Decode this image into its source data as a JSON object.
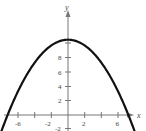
{
  "chart_data": {
    "type": "line",
    "title": "",
    "xlabel": "x",
    "ylabel": "y",
    "xlim": [
      -7,
      7
    ],
    "ylim": [
      -2,
      12
    ],
    "x_ticks": [
      -6,
      -4,
      -2,
      2,
      4,
      6
    ],
    "x_tick_labels": [
      "-6",
      "-4",
      "-2",
      "2",
      "4",
      "6"
    ],
    "y_ticks": [
      -2,
      2,
      4,
      6,
      8,
      10
    ],
    "y_tick_labels": [
      "-2",
      "2",
      "4",
      "6",
      "8",
      ""
    ],
    "grid": false,
    "legend": null,
    "series": [
      {
        "name": "parabola",
        "equation": "y = 10.5 - 0.8x^2",
        "x": [
          -3.9,
          -3,
          -2,
          -1,
          0,
          1,
          2,
          3,
          3.9
        ],
        "y": [
          -1.7,
          3.3,
          7.3,
          9.7,
          10.5,
          9.7,
          7.3,
          3.3,
          -1.7
        ]
      }
    ]
  },
  "labels": {
    "x_axis": "x",
    "y_axis": "y",
    "xt_m6": "-6",
    "xt_m4": "-4",
    "xt_m2": "-2",
    "xt_2": "2",
    "xt_4": "4",
    "xt_6": "6",
    "yt_m2": "-2",
    "yt_2": "2",
    "yt_4": "4",
    "yt_6": "6",
    "yt_8": "8"
  }
}
